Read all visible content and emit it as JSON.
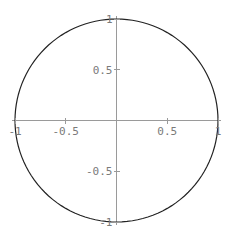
{
  "chart_data": {
    "type": "line",
    "title": "",
    "xlabel": "",
    "ylabel": "",
    "xlim": [
      -1,
      1
    ],
    "ylim": [
      -1,
      1
    ],
    "grid": false,
    "legend": "none",
    "axes_origin": [
      0,
      0
    ],
    "x_ticks": [
      {
        "value": -1,
        "label": "-1"
      },
      {
        "value": -0.5,
        "label": "-0.5"
      },
      {
        "value": 0.5,
        "label": "0.5"
      },
      {
        "value": 1,
        "label": "1"
      }
    ],
    "y_ticks": [
      {
        "value": 1,
        "label": "1"
      },
      {
        "value": 0.5,
        "label": "0.5"
      },
      {
        "value": -0.5,
        "label": "-0.5"
      },
      {
        "value": -1,
        "label": "-1"
      }
    ],
    "series": [
      {
        "name": "unit circle",
        "parametric": "x = cos(t), y = sin(t), t in [0, 2π]",
        "color": "#222222",
        "samples": 120
      }
    ]
  },
  "colors": {
    "axis": "#9a9a9a",
    "tick_label": "#7a7a7a",
    "curve": "#222222",
    "background": "#ffffff"
  }
}
